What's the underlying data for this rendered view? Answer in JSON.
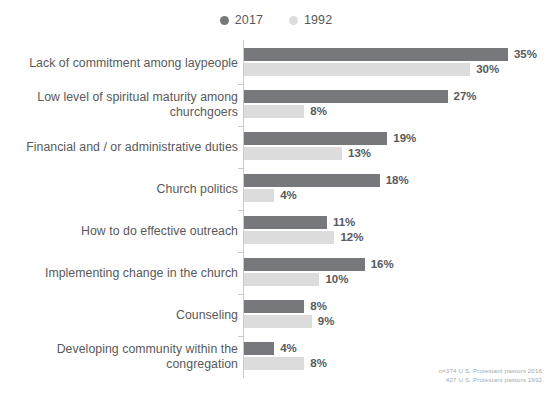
{
  "legend": {
    "entries": [
      {
        "label": "2017",
        "color": "#77787b",
        "icon": "legend-dot-icon"
      },
      {
        "label": "1992",
        "color": "#dcdcdc",
        "icon": "legend-dot-icon"
      }
    ]
  },
  "footnote": {
    "line1": "n=374 U.S. Protestant pastors 2016;",
    "line2": "427 U.S. Protestant pastors 1992."
  },
  "chart_data": {
    "type": "bar",
    "orientation": "horizontal",
    "title": "",
    "subtitle": "",
    "xlabel": "",
    "ylabel": "",
    "xlim": [
      0,
      35
    ],
    "grid": false,
    "legend_position": "top-center",
    "value_suffix": "%",
    "categories": [
      "Lack of commitment among laypeople",
      "Low level of spiritual maturity among churchgoers",
      "Financial and / or administrative duties",
      "Church politics",
      "How to do effective outreach",
      "Implementing change in the church",
      "Counseling",
      "Developing community within the congregation"
    ],
    "category_lines": [
      [
        "Lack of commitment among laypeople"
      ],
      [
        "Low level of spiritual maturity among",
        "churchgoers"
      ],
      [
        "Financial and / or administrative duties"
      ],
      [
        "Church politics"
      ],
      [
        "How to do effective outreach"
      ],
      [
        "Implementing change in the church"
      ],
      [
        "Counseling"
      ],
      [
        "Developing community within the",
        "congregation"
      ]
    ],
    "series": [
      {
        "name": "2017",
        "color": "#77787b",
        "values": [
          35,
          27,
          19,
          18,
          11,
          16,
          8,
          4
        ],
        "labels": [
          "35%",
          "27%",
          "19%",
          "18%",
          "11%",
          "16%",
          "8%",
          "4%"
        ]
      },
      {
        "name": "1992",
        "color": "#dcdcdc",
        "values": [
          30,
          8,
          13,
          4,
          12,
          10,
          9,
          8
        ],
        "labels": [
          "30%",
          "8%",
          "13%",
          "4%",
          "12%",
          "10%",
          "9%",
          "8%"
        ]
      }
    ]
  }
}
